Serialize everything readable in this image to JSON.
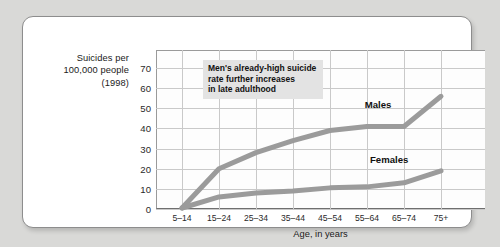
{
  "y_axis_caption": [
    "Suicides per",
    "100,000 people",
    "(1998)"
  ],
  "annotation": [
    "Men's already-high suicide",
    "rate further increases",
    "in late adulthood"
  ],
  "labels": {
    "males": "Males",
    "females": "Females"
  },
  "colors": {
    "page_background": "#d9d9d7",
    "card_background": "#ffffff",
    "card_border": "#8d8d8d",
    "grid": "#c9c9c9",
    "axis": "#6f6f6f",
    "series_line": "#9b9b9b",
    "annotation_background": "#e3e3e3",
    "text": "#1a1a1a"
  },
  "chart_data": {
    "type": "line",
    "title": "",
    "xlabel": "Age, in years",
    "ylabel": "Suicides per 100,000 people (1998)",
    "categories": [
      "5–14",
      "15–24",
      "25–34",
      "35–44",
      "45–54",
      "55–64",
      "65–74",
      "75+"
    ],
    "yticks": [
      0,
      10,
      20,
      30,
      40,
      50,
      60,
      70
    ],
    "ylim": [
      0,
      79
    ],
    "grid": true,
    "legend": "inline-labels",
    "series": [
      {
        "name": "Males",
        "values": [
          0.5,
          20,
          28,
          34,
          39,
          41,
          41,
          56
        ]
      },
      {
        "name": "Females",
        "values": [
          0.5,
          6,
          8,
          9,
          10.5,
          11,
          13,
          19
        ]
      }
    ],
    "annotations": [
      {
        "text": "Men's already-high suicide rate further increases in late adulthood",
        "target": "Males"
      }
    ]
  }
}
